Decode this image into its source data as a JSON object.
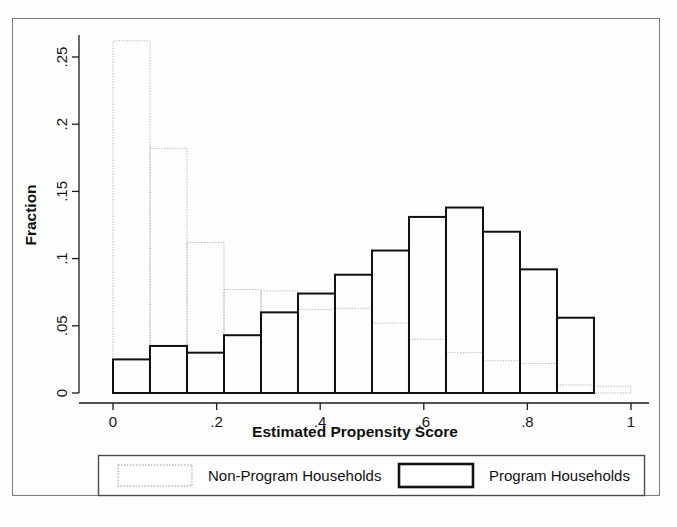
{
  "figure": {
    "background_color": "#fdfdfd",
    "frame_color": "#7d7d7d"
  },
  "legend": {
    "entries": [
      {
        "label": "Non-Program Households",
        "swatch_style": "light-dotted",
        "color": "#b9b9b9"
      },
      {
        "label": "Program Households",
        "swatch_style": "thick-solid",
        "color": "#111111"
      }
    ]
  },
  "chart_data": {
    "type": "bar",
    "subtype": "overlaid-histogram",
    "title": "",
    "xlabel": "Estimated Propensity Score",
    "ylabel": "Fraction",
    "xlim": [
      0,
      1
    ],
    "ylim": [
      0,
      0.275
    ],
    "grid": false,
    "legend_position": "below-axis",
    "xticks": [
      0,
      0.2,
      0.4,
      0.6,
      0.8,
      1
    ],
    "xtick_labels": [
      "0",
      ".2",
      ".4",
      ".6",
      ".8",
      "1"
    ],
    "yticks": [
      0,
      0.05,
      0.1,
      0.15,
      0.2,
      0.25
    ],
    "ytick_labels": [
      "0",
      ".05",
      ".1",
      ".15",
      ".2",
      ".25"
    ],
    "bin_width": 0.0714,
    "bin_left_edges": [
      0,
      0.0714,
      0.1429,
      0.2143,
      0.2857,
      0.3571,
      0.4286,
      0.5,
      0.5714,
      0.6429,
      0.7143,
      0.7857,
      0.8571,
      0.9286
    ],
    "bin_centers": [
      0.036,
      0.107,
      0.179,
      0.25,
      0.321,
      0.393,
      0.464,
      0.536,
      0.607,
      0.679,
      0.75,
      0.821,
      0.893,
      0.964
    ],
    "series": [
      {
        "name": "Non-Program Households",
        "color": "#b9b9b9",
        "line_style": "dotted",
        "line_width": 1,
        "values": [
          0.262,
          0.182,
          0.112,
          0.077,
          0.076,
          0.062,
          0.063,
          0.052,
          0.04,
          0.03,
          0.024,
          0.022,
          0.006,
          0.005
        ]
      },
      {
        "name": "Program Households",
        "color": "#111111",
        "line_style": "solid",
        "line_width": 2,
        "values": [
          0.025,
          0.035,
          0.03,
          0.043,
          0.06,
          0.074,
          0.088,
          0.106,
          0.131,
          0.138,
          0.12,
          0.092,
          0.056,
          0.0
        ]
      }
    ]
  }
}
